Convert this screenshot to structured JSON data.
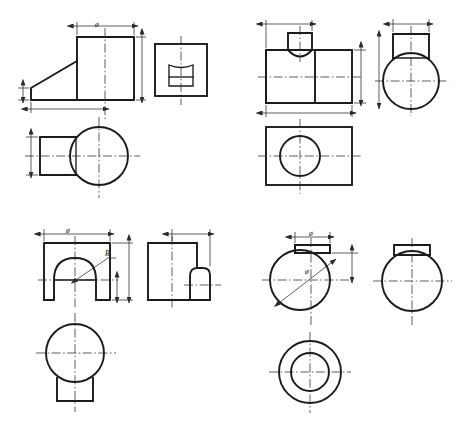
{
  "page": {
    "background_color": "#ffffff",
    "line_color": "#1b1b1b",
    "centerline_color": "#2a2a2a",
    "width": 465,
    "height": 437
  },
  "groups": [
    {
      "id": "group-top-left",
      "name": "wedge-block-with-cylindrical-boss",
      "views": [
        {
          "name": "front-view",
          "description": "stepped wedge profile with sloped ramp"
        },
        {
          "name": "left-side-view",
          "description": "square outline with inner rectangle having concave arched top"
        },
        {
          "name": "top-view",
          "description": "circle with rectangular tongue extending left"
        }
      ],
      "dimensions": [
        {
          "name": "width-dimension-top",
          "label": "ø"
        },
        {
          "name": "height-dimension-right",
          "label": ""
        },
        {
          "name": "height-dimension-left",
          "label": ""
        },
        {
          "name": "length-dimension-bottom",
          "label": ""
        },
        {
          "name": "width-dimension-topview-left",
          "label": ""
        }
      ]
    },
    {
      "id": "group-top-right",
      "name": "rectangular-block-with-round-top-boss",
      "views": [
        {
          "name": "front-view",
          "description": "rectangle with trapezoidal boss and concave arc underside"
        },
        {
          "name": "right-side-view",
          "description": "circle with rectangular boss on top"
        },
        {
          "name": "top-view",
          "description": "rectangle with central circle"
        }
      ],
      "dimensions": [
        {
          "name": "boss-width-dimension",
          "label": ""
        },
        {
          "name": "height-dimension-right",
          "label": ""
        },
        {
          "name": "length-dimension-bottom",
          "label": ""
        },
        {
          "name": "side-width-dimension-top",
          "label": ""
        },
        {
          "name": "side-height-dimension-left",
          "label": ""
        }
      ]
    },
    {
      "id": "group-bottom-left",
      "name": "block-with-semicircular-slot",
      "views": [
        {
          "name": "front-view",
          "description": "square with semicircular arch slot opening downward"
        },
        {
          "name": "right-side-view",
          "description": "rectangle with stepped fillet shoulder at right"
        },
        {
          "name": "top-view",
          "description": "circle with square tab below"
        }
      ],
      "dimensions": [
        {
          "name": "width-dimension-top",
          "label": "ø"
        },
        {
          "name": "radius-leader",
          "label": "R"
        },
        {
          "name": "height-dimension-right",
          "label": ""
        },
        {
          "name": "step-height-dimension",
          "label": ""
        },
        {
          "name": "side-width-dimension-top",
          "label": ""
        }
      ]
    },
    {
      "id": "group-bottom-right",
      "name": "cylinder-with-key-boss-and-bore",
      "views": [
        {
          "name": "front-view",
          "description": "circle with rectangular key boss on top, diameter leader"
        },
        {
          "name": "right-side-view",
          "description": "circle with rectangular boss on top"
        },
        {
          "name": "bottom-view",
          "description": "concentric circles (annulus) - through bore"
        }
      ],
      "dimensions": [
        {
          "name": "boss-width-dimension",
          "label": "ø"
        },
        {
          "name": "diameter-leader",
          "label": "ø"
        },
        {
          "name": "height-dimension-right",
          "label": ""
        }
      ]
    }
  ],
  "labels": [
    {
      "id": "lbl-tl-diameter",
      "text": "ø",
      "x": 95,
      "y": 27
    },
    {
      "id": "lbl-bl-diameter",
      "text": "ø",
      "x": 66,
      "y": 233
    },
    {
      "id": "lbl-bl-radius",
      "text": "R",
      "x": 103,
      "y": 256
    },
    {
      "id": "lbl-br-diameter-top",
      "text": "ø",
      "x": 310,
      "y": 237
    },
    {
      "id": "lbl-br-diameter-leader",
      "text": "ø",
      "x": 312,
      "y": 271
    }
  ]
}
